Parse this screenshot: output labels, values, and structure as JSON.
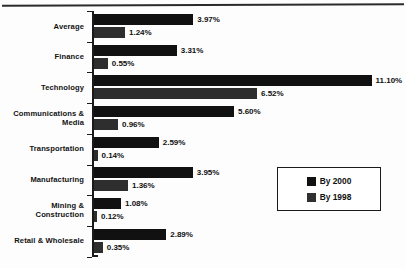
{
  "chart_data": {
    "type": "bar",
    "orientation": "horizontal",
    "title": "",
    "subtitle": "",
    "xlabel": "",
    "ylabel": "",
    "grid": false,
    "axis_visible": true,
    "xlim": [
      0,
      11.6
    ],
    "value_suffix": "%",
    "legend_position": "inside-right",
    "categories": [
      "Average",
      "Finance",
      "Technology",
      "Communications & Media",
      "Transportation",
      "Manufacturing",
      "Mining & Construction",
      "Retail & Wholesale"
    ],
    "series": [
      {
        "name": "By 2000",
        "color": "#111111",
        "values": [
          3.97,
          3.31,
          11.1,
          5.6,
          2.59,
          3.95,
          1.08,
          2.89
        ],
        "labels": [
          "3.97%",
          "3.31%",
          "11.10%",
          "5.60%",
          "2.59%",
          "3.95%",
          "1.08%",
          "2.89%"
        ]
      },
      {
        "name": "By 1998",
        "color": "#2e2e2e",
        "values": [
          1.24,
          0.55,
          6.52,
          0.96,
          0.14,
          1.36,
          0.12,
          0.35
        ],
        "labels": [
          "1.24%",
          "0.55%",
          "6.52%",
          "0.96%",
          "0.14%",
          "1.36%",
          "0.12%",
          "0.35%"
        ]
      }
    ]
  },
  "rows": [
    {
      "label": "Average",
      "label_lines": [
        "Average"
      ],
      "by2000": {
        "value": 3.97,
        "text": "3.97%"
      },
      "by1998": {
        "value": 1.24,
        "text": "1.24%"
      }
    },
    {
      "label": "Finance",
      "label_lines": [
        "Finance"
      ],
      "by2000": {
        "value": 3.31,
        "text": "3.31%"
      },
      "by1998": {
        "value": 0.55,
        "text": "0.55%"
      }
    },
    {
      "label": "Technology",
      "label_lines": [
        "Technology"
      ],
      "by2000": {
        "value": 11.1,
        "text": "11.10%"
      },
      "by1998": {
        "value": 6.52,
        "text": "6.52%"
      }
    },
    {
      "label": "Communications & Media",
      "label_lines": [
        "Communications &",
        "Media"
      ],
      "by2000": {
        "value": 5.6,
        "text": "5.60%"
      },
      "by1998": {
        "value": 0.96,
        "text": "0.96%"
      }
    },
    {
      "label": "Transportation",
      "label_lines": [
        "Transportation"
      ],
      "by2000": {
        "value": 2.59,
        "text": "2.59%"
      },
      "by1998": {
        "value": 0.14,
        "text": "0.14%"
      }
    },
    {
      "label": "Manufacturing",
      "label_lines": [
        "Manufacturing"
      ],
      "by2000": {
        "value": 3.95,
        "text": "3.95%"
      },
      "by1998": {
        "value": 1.36,
        "text": "1.36%"
      }
    },
    {
      "label": "Mining & Construction",
      "label_lines": [
        "Mining &",
        "Construction"
      ],
      "by2000": {
        "value": 1.08,
        "text": "1.08%"
      },
      "by1998": {
        "value": 0.12,
        "text": "0.12%"
      }
    },
    {
      "label": "Retail & Wholesale",
      "label_lines": [
        "Retail & Wholesale"
      ],
      "by2000": {
        "value": 2.89,
        "text": "2.89%"
      },
      "by1998": {
        "value": 0.35,
        "text": "0.35%"
      }
    }
  ],
  "legend": {
    "items": [
      {
        "label": "By 2000",
        "color": "#111111"
      },
      {
        "label": "By 1998",
        "color": "#2e2e2e"
      }
    ]
  },
  "scale": {
    "px_per_percent": 25.0
  },
  "colors": {
    "series_2000": "#111111",
    "series_1998": "#2e2e2e",
    "axis": "#1a1a1a",
    "text": "#101010",
    "background": "#fdfdfd"
  }
}
